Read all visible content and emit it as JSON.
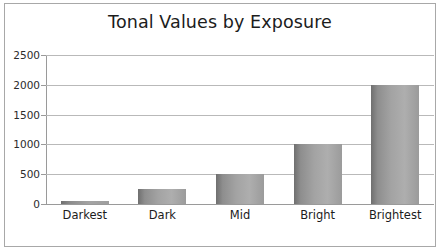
{
  "chart_data": {
    "type": "bar",
    "title": "Tonal Values by Exposure",
    "xlabel": "",
    "ylabel": "",
    "categories": [
      "Darkest",
      "Dark",
      "Mid",
      "Bright",
      "Brightest"
    ],
    "values": [
      50,
      250,
      500,
      1000,
      2000
    ],
    "ylim": [
      0,
      2500
    ],
    "yticks": [
      0,
      500,
      1000,
      1500,
      2000,
      2500
    ],
    "ytick_labels": [
      "0",
      "500",
      "1000",
      "1500",
      "2000",
      "2500"
    ],
    "grid": true,
    "legend": null,
    "series": [
      {
        "name": "Tonal Value",
        "values": [
          50,
          250,
          500,
          1000,
          2000
        ]
      }
    ],
    "colors": {
      "bar_dark": "#6f6f6f",
      "bar_light": "#aeaeae",
      "gridline": "#b9b9b9",
      "axis": "#9a9a9a",
      "text": "#1c1c1c",
      "background": "#ffffff",
      "frame": "#a8a8a8"
    }
  }
}
